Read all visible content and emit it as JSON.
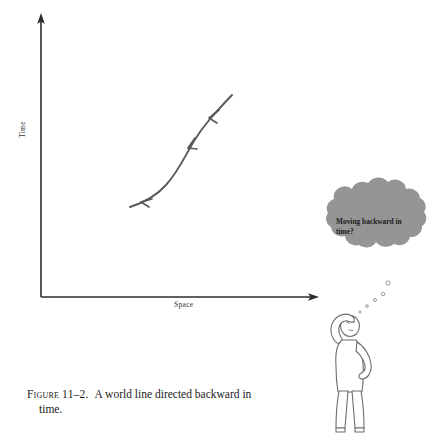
{
  "figure": {
    "caption_number": "Figure 11–2.",
    "caption_text": "A world line directed backward in",
    "caption_text_line2": "time.",
    "background_color": "#ffffff"
  },
  "diagram": {
    "type": "spacetime-world-line-diagram",
    "axes": {
      "y_label": "Time",
      "x_label": "Space",
      "color": "#2b2b2b",
      "origin": [
        41,
        297
      ],
      "y_top": [
        41,
        14
      ],
      "x_right": [
        318,
        297
      ]
    },
    "world_line": {
      "name": "world-line-curve",
      "color": "#59595b",
      "description": "S-shaped curve with three arrowheads directed down-left (backward in time)",
      "start_point": [
        232,
        95
      ],
      "end_point": [
        130,
        207
      ],
      "arrow_count": 3,
      "arrow_direction": "down-left"
    }
  },
  "thought_bubble": {
    "name": "thought-bubble",
    "text_line1": "Moving backward",
    "text_line2": "in time?",
    "fill_color": "#959595",
    "text_color": "#1c1c1c",
    "dot_count": 5
  },
  "character": {
    "name": "puzzled-stick-figure",
    "stroke_color": "#6d6d6d",
    "fill_color": "#ffffff",
    "pose": "hand-on-head-hand-on-hip-looking-up"
  }
}
